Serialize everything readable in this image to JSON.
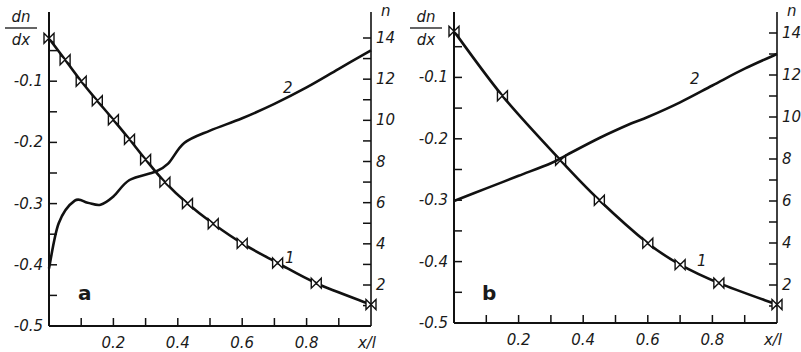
{
  "figure": {
    "panels": [
      {
        "id": "a",
        "label": "a",
        "left_axis_label_num": "dn",
        "left_axis_label_den": "dx",
        "right_axis_label": "n",
        "x_axis_label": "x/l",
        "left_ticks": [
          "-0.1",
          "-0.2",
          "-0.3",
          "-0.4",
          "-0.5"
        ],
        "right_ticks": [
          "14",
          "12",
          "10",
          "8",
          "6",
          "4",
          "2"
        ],
        "x_ticks": [
          "0.2",
          "0.4",
          "0.6",
          "0.8"
        ],
        "curve1_label": "1",
        "curve2_label": "2"
      },
      {
        "id": "b",
        "label": "b",
        "left_axis_label_num": "dn",
        "left_axis_label_den": "dx",
        "right_axis_label": "n",
        "x_axis_label": "x/l",
        "left_ticks": [
          "-0.1",
          "-0.2",
          "-0.3",
          "-0.4",
          "-0.5"
        ],
        "right_ticks": [
          "14",
          "12",
          "10",
          "8",
          "6",
          "4",
          "2"
        ],
        "x_ticks": [
          "0.2",
          "0.4",
          "0.6",
          "0.8"
        ],
        "curve1_label": "1",
        "curve2_label": "2"
      }
    ]
  },
  "chart_data": [
    {
      "type": "line",
      "title": "a",
      "xlabel": "x/l",
      "ylabel": "dn/dx",
      "y2label": "n",
      "xlim": [
        0,
        1.0
      ],
      "ylim": [
        -0.5,
        0
      ],
      "y2lim": [
        0,
        15
      ],
      "x_ticks": [
        0.2,
        0.4,
        0.6,
        0.8
      ],
      "y_ticks": [
        -0.1,
        -0.2,
        -0.3,
        -0.4,
        -0.5
      ],
      "y2_ticks": [
        2,
        4,
        6,
        8,
        10,
        12,
        14
      ],
      "grid": false,
      "series": [
        {
          "name": "1",
          "axis": "left (dn/dx)",
          "marker": "bowtie",
          "x": [
            0.0,
            0.05,
            0.1,
            0.15,
            0.2,
            0.25,
            0.3,
            0.36,
            0.43,
            0.51,
            0.6,
            0.71,
            0.83,
            1.0
          ],
          "values": [
            -0.03,
            -0.065,
            -0.1,
            -0.132,
            -0.163,
            -0.195,
            -0.228,
            -0.265,
            -0.3,
            -0.333,
            -0.365,
            -0.397,
            -0.43,
            -0.465
          ]
        },
        {
          "name": "2",
          "axis": "right (n)",
          "marker": "none",
          "x": [
            0.0,
            0.03,
            0.08,
            0.12,
            0.16,
            0.2,
            0.25,
            0.33,
            0.37,
            0.42,
            0.5,
            0.6,
            0.7,
            0.8,
            0.9,
            1.0
          ],
          "values": [
            2.8,
            5.0,
            6.1,
            6.0,
            5.9,
            6.3,
            7.1,
            7.5,
            7.9,
            8.9,
            9.5,
            10.1,
            10.8,
            11.6,
            12.5,
            13.4
          ]
        }
      ]
    },
    {
      "type": "line",
      "title": "b",
      "xlabel": "x/l",
      "ylabel": "dn/dx",
      "y2label": "n",
      "xlim": [
        0,
        1.0
      ],
      "ylim": [
        -0.5,
        0
      ],
      "y2lim": [
        0,
        15
      ],
      "x_ticks": [
        0.2,
        0.4,
        0.6,
        0.8
      ],
      "y_ticks": [
        -0.1,
        -0.2,
        -0.3,
        -0.4,
        -0.5
      ],
      "y2_ticks": [
        2,
        4,
        6,
        8,
        10,
        12,
        14
      ],
      "grid": false,
      "series": [
        {
          "name": "1",
          "axis": "left (dn/dx)",
          "marker": "bowtie",
          "x": [
            0.0,
            0.15,
            0.33,
            0.45,
            0.6,
            0.7,
            0.82,
            1.0
          ],
          "values": [
            -0.025,
            -0.13,
            -0.235,
            -0.3,
            -0.37,
            -0.405,
            -0.435,
            -0.47
          ]
        },
        {
          "name": "2",
          "axis": "right (n)",
          "marker": "none",
          "x": [
            0.0,
            0.1,
            0.2,
            0.3,
            0.35,
            0.45,
            0.55,
            0.6,
            0.7,
            0.8,
            0.9,
            1.0
          ],
          "values": [
            6.0,
            6.6,
            7.2,
            7.8,
            8.2,
            9.0,
            9.7,
            10.0,
            10.7,
            11.5,
            12.3,
            13.0
          ]
        }
      ]
    }
  ]
}
